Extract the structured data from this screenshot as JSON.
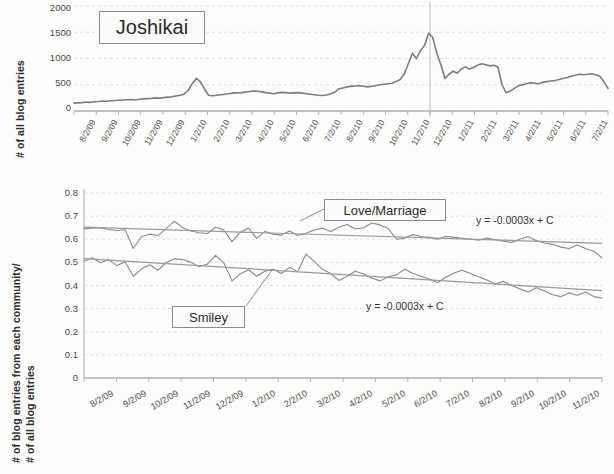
{
  "figure": {
    "background_color": "#fdfdfc",
    "line_color": "#7d7d7d",
    "trend_color": "#9a9a9a",
    "grid_color": "#d8d8d8",
    "axis_color": "#a9a9a9"
  },
  "top_chart": {
    "label_box": "Joshikai",
    "y_axis_title": "# of all blog entries",
    "y_ticks": [
      "0",
      "500",
      "1000",
      "1500",
      "2000"
    ],
    "x_ticks": [
      "8/2/09",
      "9/2/09",
      "10/2/09",
      "11/2/09",
      "12/2/09",
      "1/2/10",
      "2/2/10",
      "3/2/10",
      "4/2/10",
      "5/2/10",
      "6/2/10",
      "7/2/10",
      "8/2/10",
      "9/2/10",
      "10/2/10",
      "11/2/10",
      "12/2/10",
      "1/2/11",
      "2/2/11",
      "3/2/11",
      "4/2/11",
      "5/2/11",
      "6/2/11",
      "7/2/11"
    ]
  },
  "bottom_chart": {
    "y_axis_title_line1": "# of blog entries from each community/",
    "y_axis_title_line2": "# of all blog entries",
    "y_ticks": [
      "0.8",
      "0.7",
      "0.6",
      "0.5",
      "0.4",
      "0.3",
      "0.2",
      "0.1",
      "0"
    ],
    "x_ticks": [
      "8/2/09",
      "9/2/09",
      "10/2/09",
      "11/2/09",
      "12/2/09",
      "1/2/10",
      "2/2/10",
      "3/2/10",
      "4/2/10",
      "5/2/10",
      "6/2/10",
      "7/2/10",
      "8/2/10",
      "9/2/10",
      "10/2/10",
      "11/2/10"
    ],
    "series_label_upper": "Love/Marriage",
    "series_label_lower": "Smiley",
    "equation_upper": "y = -0.0003x + C",
    "equation_lower": "y = -0.0003x + C"
  },
  "chart_data": [
    {
      "type": "line",
      "title": "Joshikai",
      "xlabel": "",
      "ylabel": "# of all blog entries",
      "ylim": [
        0,
        2000
      ],
      "yticks": [
        0,
        500,
        1000,
        1500,
        2000
      ],
      "grid": true,
      "legend": "none",
      "x": [
        "8/2/09",
        "9/2/09",
        "10/2/09",
        "11/2/09",
        "12/2/09",
        "1/2/10",
        "2/2/10",
        "3/2/10",
        "4/2/10",
        "5/2/10",
        "6/2/10",
        "7/2/10",
        "8/2/10",
        "9/2/10",
        "10/2/10",
        "11/2/10",
        "12/2/10",
        "1/2/11",
        "2/2/11",
        "3/2/11",
        "4/2/11",
        "5/2/11",
        "6/2/11",
        "7/2/11"
      ],
      "series": [
        {
          "name": "Joshikai",
          "values": [
            150,
            155,
            160,
            170,
            165,
            175,
            180,
            190,
            185,
            195,
            200,
            205,
            210,
            215,
            220,
            210,
            225,
            230,
            235,
            240,
            250,
            245,
            255,
            265,
            270,
            285,
            300,
            320,
            390,
            520,
            620,
            560,
            420,
            300,
            290,
            300,
            310,
            320,
            330,
            340,
            345,
            350,
            360,
            370,
            380,
            375,
            365,
            350,
            340,
            330,
            345,
            355,
            350,
            340,
            345,
            350,
            340,
            330,
            320,
            310,
            300,
            295,
            305,
            330,
            360,
            420,
            440,
            460,
            470,
            475,
            480,
            470,
            460,
            470,
            480,
            500,
            510,
            520,
            530,
            560,
            600,
            700,
            900,
            1100,
            1000,
            1150,
            1250,
            1480,
            1400,
            1100,
            880,
            620,
            700,
            760,
            720,
            800,
            840,
            800,
            830,
            870,
            900,
            880,
            860,
            870,
            840,
            500,
            350,
            380,
            430,
            480,
            500,
            520,
            540,
            530,
            520,
            550,
            560,
            570,
            580,
            600,
            620,
            640,
            660,
            680,
            700,
            690,
            700,
            710,
            690,
            660,
            560,
            430
          ]
        }
      ]
    },
    {
      "type": "line",
      "title": "",
      "xlabel": "",
      "ylabel": "# of blog entries from each community/ # of all blog entries",
      "ylim": [
        0,
        0.8
      ],
      "yticks": [
        0,
        0.1,
        0.2,
        0.3,
        0.4,
        0.5,
        0.6,
        0.7,
        0.8
      ],
      "grid": true,
      "legend": "inline-callouts",
      "x": [
        "8/2/09",
        "9/2/09",
        "10/2/09",
        "11/2/09",
        "12/2/09",
        "1/2/10",
        "2/2/10",
        "3/2/10",
        "4/2/10",
        "5/2/10",
        "6/2/10",
        "7/2/10",
        "8/2/10",
        "9/2/10",
        "10/2/10",
        "11/2/10"
      ],
      "series": [
        {
          "name": "Love/Marriage",
          "values": [
            0.645,
            0.648,
            0.65,
            0.642,
            0.638,
            0.641,
            0.56,
            0.612,
            0.622,
            0.616,
            0.646,
            0.678,
            0.65,
            0.636,
            0.628,
            0.625,
            0.652,
            0.64,
            0.59,
            0.63,
            0.648,
            0.604,
            0.634,
            0.622,
            0.618,
            0.636,
            0.616,
            0.626,
            0.64,
            0.648,
            0.634,
            0.652,
            0.664,
            0.644,
            0.65,
            0.67,
            0.662,
            0.646,
            0.6,
            0.605,
            0.62,
            0.612,
            0.608,
            0.6,
            0.612,
            0.608,
            0.604,
            0.6,
            0.596,
            0.605,
            0.598,
            0.592,
            0.586,
            0.6,
            0.612,
            0.594,
            0.584,
            0.578,
            0.566,
            0.56,
            0.575,
            0.56,
            0.548,
            0.52
          ],
          "trend": "y = -0.0003x + C"
        },
        {
          "name": "Smiley",
          "values": [
            0.505,
            0.52,
            0.498,
            0.512,
            0.486,
            0.502,
            0.44,
            0.472,
            0.49,
            0.466,
            0.5,
            0.516,
            0.512,
            0.5,
            0.482,
            0.492,
            0.53,
            0.498,
            0.42,
            0.45,
            0.468,
            0.44,
            0.462,
            0.47,
            0.452,
            0.478,
            0.46,
            0.536,
            0.504,
            0.47,
            0.452,
            0.422,
            0.44,
            0.462,
            0.45,
            0.432,
            0.42,
            0.438,
            0.446,
            0.47,
            0.452,
            0.44,
            0.428,
            0.412,
            0.436,
            0.454,
            0.466,
            0.452,
            0.438,
            0.424,
            0.406,
            0.418,
            0.4,
            0.386,
            0.372,
            0.39,
            0.376,
            0.36,
            0.352,
            0.368,
            0.358,
            0.372,
            0.352,
            0.346
          ],
          "trend": "y = -0.0003x + C"
        }
      ]
    }
  ]
}
